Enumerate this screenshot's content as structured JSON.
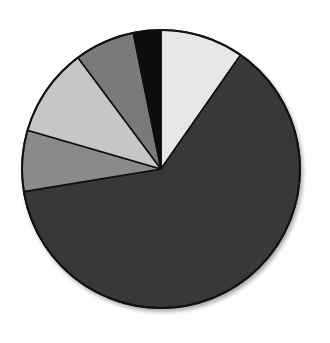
{
  "chart_data": {
    "type": "pie",
    "title": "",
    "legend": [],
    "start_angle_deg": 0,
    "direction": "clockwise",
    "slices": [
      {
        "label": "",
        "value": 9.7,
        "color": "#e6e6e6"
      },
      {
        "label": "",
        "value": 62.7,
        "color": "#383838"
      },
      {
        "label": "",
        "value": 7.1,
        "color": "#8a8a8a"
      },
      {
        "label": "",
        "value": 10.3,
        "color": "#c6c6c6"
      },
      {
        "label": "",
        "value": 7.0,
        "color": "#7a7a7a"
      },
      {
        "label": "",
        "value": 3.2,
        "color": "#0a0a0a"
      }
    ],
    "values": [
      9.7,
      62.7,
      7.1,
      10.3,
      7.0,
      3.2
    ],
    "categories": [
      "",
      "",
      "",
      "",
      "",
      ""
    ],
    "geometry": {
      "cx": 161,
      "cy": 169,
      "r": 139
    }
  }
}
